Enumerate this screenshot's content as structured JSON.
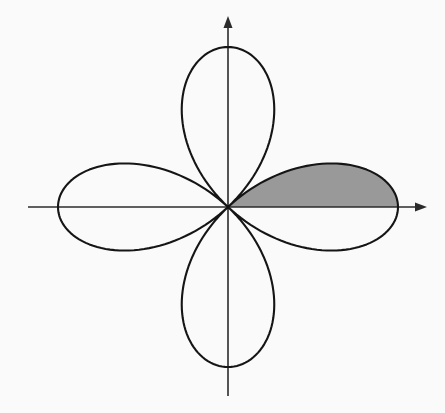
{
  "figure": {
    "title": "",
    "background_color": "#fafafa",
    "width": 445,
    "height": 413
  },
  "axes": {
    "origin": {
      "x": 228,
      "y": 207
    },
    "x_axis": {
      "name": "horizontal-axis",
      "label": "",
      "start_x": 28,
      "end_x": 427,
      "y": 207,
      "arrow_at": "positive-end",
      "color": "#2b2b2b"
    },
    "y_axis": {
      "name": "vertical-axis",
      "label": "",
      "x": 228,
      "start_y": 396,
      "end_y": 16,
      "arrow_at": "positive-end",
      "color": "#2b2b2b"
    }
  },
  "chart_data": {
    "type": "line",
    "plot_kind": "polar-rose",
    "title": "",
    "subtitle": "",
    "xlabel": "",
    "ylabel": "",
    "grid": false,
    "legend": null,
    "equation": "r = a cos(2θ)",
    "petal_count": 4,
    "amplitude_px_x": 170,
    "amplitude_px_y": 160,
    "theta_start_deg": 0,
    "theta_end_deg": 360,
    "theta_step_deg": 1,
    "curve_color": "#151515",
    "curve_width": 2.1,
    "petals": [
      {
        "name": "right-petal",
        "axis_angle_deg": 0,
        "tip_x": 398,
        "tip_y": 207,
        "shaded": true
      },
      {
        "name": "top-petal",
        "axis_angle_deg": 90,
        "tip_x": 228,
        "tip_y": 47,
        "shaded": false
      },
      {
        "name": "left-petal",
        "axis_angle_deg": 180,
        "tip_x": 58,
        "tip_y": 207,
        "shaded": false
      },
      {
        "name": "bottom-petal",
        "axis_angle_deg": 270,
        "tip_x": 228,
        "tip_y": 367,
        "shaded": false
      }
    ],
    "shaded_region": {
      "name": "shaded-sector",
      "description": "upper half of the right petal",
      "theta_from_deg": 0,
      "theta_to_deg": 45,
      "fill_color": "#999999",
      "bounded_below_by": "positive x-axis"
    },
    "annotations": []
  }
}
